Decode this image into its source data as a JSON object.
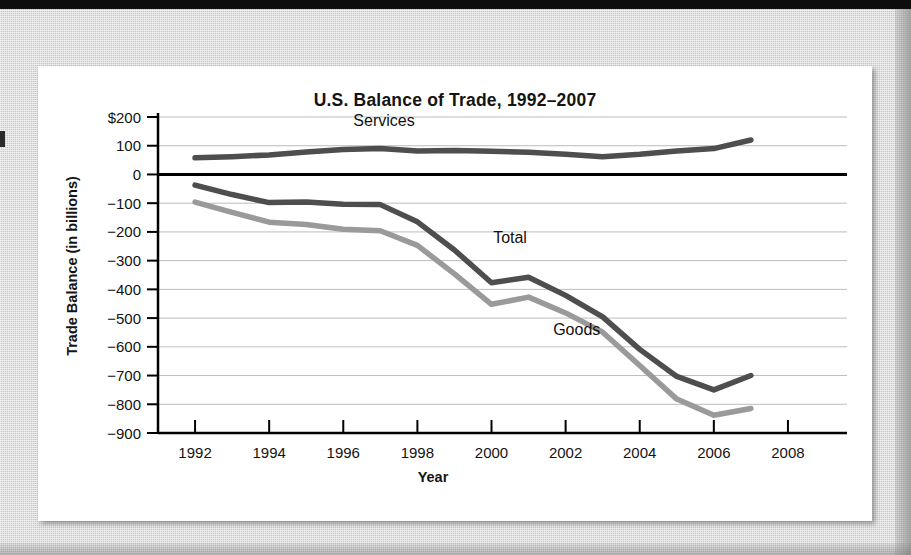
{
  "chart_data": {
    "type": "line",
    "title": "U.S. Balance of Trade, 1992–2007",
    "xlabel": "Year",
    "ylabel": "Trade Balance (in billions)",
    "grid": true,
    "legend_position": "inline-labels",
    "x": [
      1992,
      1993,
      1994,
      1995,
      1996,
      1997,
      1998,
      1999,
      2000,
      2001,
      2002,
      2003,
      2004,
      2005,
      2006,
      2007
    ],
    "xlim": [
      1991,
      2009
    ],
    "ylim": [
      -900,
      200
    ],
    "xticks": [
      "1992",
      "1994",
      "1996",
      "1998",
      "2000",
      "2002",
      "2004",
      "2006",
      "2008"
    ],
    "xtick_values": [
      1992,
      1994,
      1996,
      1998,
      2000,
      2002,
      2004,
      2006,
      2008
    ],
    "yticks": [
      "$200",
      "100",
      "0",
      "−100",
      "−200",
      "−300",
      "−400",
      "−500",
      "−600",
      "−700",
      "−800",
      "−900"
    ],
    "ytick_values": [
      200,
      100,
      0,
      -100,
      -200,
      -300,
      -400,
      -500,
      -600,
      -700,
      -800,
      -900
    ],
    "series": [
      {
        "name": "Services",
        "label": "Services",
        "color": "#4e4e4e",
        "values": [
          58,
          62,
          68,
          78,
          87,
          90,
          82,
          83,
          81,
          77,
          70,
          62,
          70,
          82,
          90,
          120
        ]
      },
      {
        "name": "Total",
        "label": "Total",
        "color": "#4e4e4e",
        "values": [
          -37,
          -70,
          -98,
          -96,
          -104,
          -105,
          -165,
          -263,
          -377,
          -358,
          -421,
          -496,
          -609,
          -703,
          -750,
          -700
        ]
      },
      {
        "name": "Goods",
        "label": "Goods",
        "color": "#9a9a9a",
        "values": [
          -96,
          -132,
          -166,
          -174,
          -191,
          -196,
          -247,
          -346,
          -452,
          -427,
          -482,
          -549,
          -665,
          -782,
          -838,
          -815
        ]
      }
    ],
    "annotations": [
      {
        "text": "Services",
        "x": 1997.1,
        "y": 168
      },
      {
        "text": "Total",
        "x": 2000.5,
        "y": -238
      },
      {
        "text": "Goods",
        "x": 2002.3,
        "y": -560
      }
    ]
  }
}
